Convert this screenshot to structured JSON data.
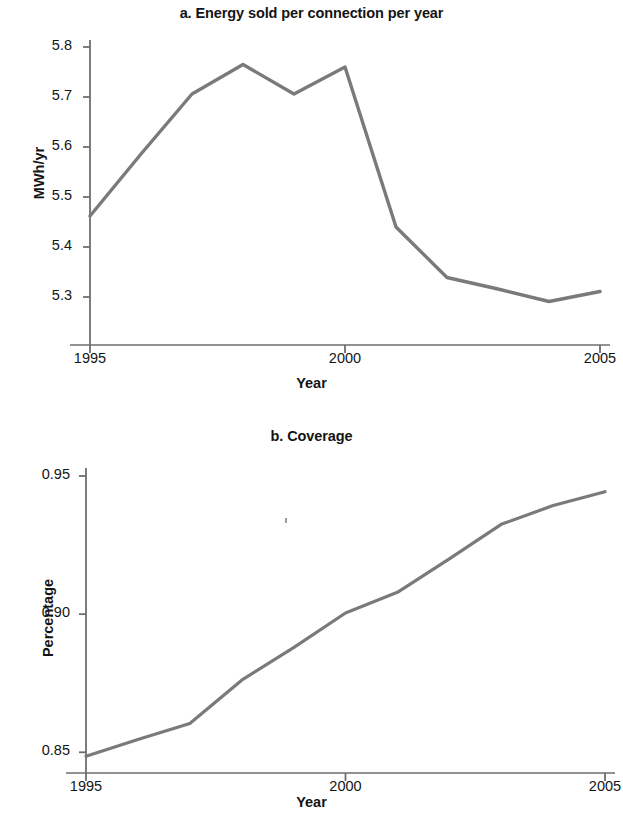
{
  "figure": {
    "panels": [
      {
        "id": "a",
        "title": "a. Energy sold per connection per year",
        "xlabel": "Year",
        "ylabel": "MWh/yr"
      },
      {
        "id": "b",
        "title": "b. Coverage",
        "xlabel": "Year",
        "ylabel": "Percentage"
      }
    ]
  },
  "chart_data": [
    {
      "type": "line",
      "title": "a. Energy sold per connection per year",
      "xlabel": "Year",
      "ylabel": "MWh/yr",
      "x": [
        1995,
        1996,
        1997,
        1998,
        1999,
        2000,
        2001,
        2002,
        2003,
        2004,
        2005
      ],
      "values": [
        5.462,
        5.586,
        5.706,
        5.765,
        5.706,
        5.76,
        5.44,
        5.339,
        5.316,
        5.291,
        5.311
      ],
      "xtick_labels": [
        "1995",
        "2000",
        "2005"
      ],
      "xticks": [
        1995,
        2000,
        2005
      ],
      "ytick_labels": [
        "5.3",
        "5.4",
        "5.5",
        "5.6",
        "5.7",
        "5.8"
      ],
      "yticks": [
        5.3,
        5.4,
        5.5,
        5.6,
        5.7,
        5.8
      ],
      "xlim": [
        1995,
        2005
      ],
      "ylim": [
        5.204,
        5.8
      ],
      "grid": false,
      "legend": false,
      "line_color": "#7a7a7a",
      "axis_color": "#6e6e6e"
    },
    {
      "type": "line",
      "title": "b. Coverage",
      "xlabel": "Year",
      "ylabel": "Percentage",
      "x": [
        1995,
        1996,
        1997,
        1998,
        1999,
        2000,
        2001,
        2002,
        2003,
        2004,
        2005
      ],
      "values": [
        0.8486,
        0.8546,
        0.8604,
        0.8761,
        0.8879,
        0.9004,
        0.9079,
        0.92,
        0.9325,
        0.9393,
        0.9443
      ],
      "xtick_labels": [
        "1995",
        "2000",
        "2005"
      ],
      "xticks": [
        1995,
        2000,
        2005
      ],
      "ytick_labels": [
        "0.85",
        "0.90",
        "0.95"
      ],
      "yticks": [
        0.85,
        0.9,
        0.95
      ],
      "xlim": [
        1995,
        2005
      ],
      "ylim": [
        0.8425,
        0.95
      ],
      "grid": false,
      "legend": false,
      "line_color": "#7a7a7a",
      "axis_color": "#6e6e6e"
    }
  ]
}
